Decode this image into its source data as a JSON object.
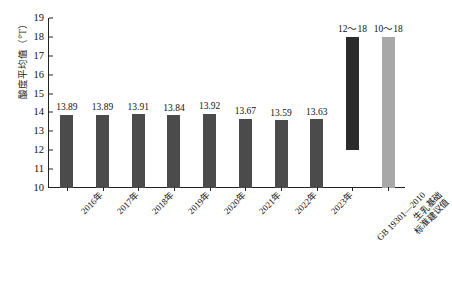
{
  "chart_data": {
    "type": "bar",
    "title": "",
    "xlabel": "",
    "ylabel": "酸度平均值（°T）",
    "ylim": [
      10,
      19
    ],
    "yticks": [
      10,
      11,
      12,
      13,
      14,
      15,
      16,
      17,
      18,
      19
    ],
    "grid": false,
    "legend": null,
    "categories": [
      "2016年",
      "2017年",
      "2018年",
      "2019年",
      "2020年",
      "2021年",
      "2022年",
      "2023年",
      "GB 19301—2010",
      "生乳基础\n标准建议值"
    ],
    "values": [
      13.89,
      13.89,
      13.91,
      13.84,
      13.92,
      13.67,
      13.59,
      13.63,
      null,
      18
    ],
    "data_labels": [
      "13.89",
      "13.89",
      "13.91",
      "13.84",
      "13.92",
      "13.67",
      "13.59",
      "13.63",
      "12～18",
      "10～18"
    ],
    "bars": [
      {
        "category": "2016年",
        "label": "13.89",
        "low": 10,
        "high": 13.89,
        "color": "#4b4b4b",
        "kind": "year"
      },
      {
        "category": "2017年",
        "label": "13.89",
        "low": 10,
        "high": 13.89,
        "color": "#4b4b4b",
        "kind": "year"
      },
      {
        "category": "2018年",
        "label": "13.91",
        "low": 10,
        "high": 13.91,
        "color": "#4b4b4b",
        "kind": "year"
      },
      {
        "category": "2019年",
        "label": "13.84",
        "low": 10,
        "high": 13.84,
        "color": "#4b4b4b",
        "kind": "year"
      },
      {
        "category": "2020年",
        "label": "13.92",
        "low": 10,
        "high": 13.92,
        "color": "#4b4b4b",
        "kind": "year"
      },
      {
        "category": "2021年",
        "label": "13.67",
        "low": 10,
        "high": 13.67,
        "color": "#4b4b4b",
        "kind": "year"
      },
      {
        "category": "2022年",
        "label": "13.59",
        "low": 10,
        "high": 13.59,
        "color": "#4b4b4b",
        "kind": "year"
      },
      {
        "category": "2023年",
        "label": "13.63",
        "low": 10,
        "high": 13.63,
        "color": "#4b4b4b",
        "kind": "year"
      },
      {
        "category": "GB 19301—2010",
        "label": "12～18",
        "low": 12,
        "high": 18,
        "color": "#2b2b2b",
        "kind": "range"
      },
      {
        "category": "生乳基础标准建议值",
        "label": "10～18",
        "low": 10,
        "high": 18,
        "color": "#a8a8a8",
        "kind": "range"
      }
    ],
    "xtick_labels": [
      {
        "text": "2016年",
        "lines": [
          "2016年"
        ]
      },
      {
        "text": "2017年",
        "lines": [
          "2017年"
        ]
      },
      {
        "text": "2018年",
        "lines": [
          "2018年"
        ]
      },
      {
        "text": "2019年",
        "lines": [
          "2019年"
        ]
      },
      {
        "text": "2020年",
        "lines": [
          "2020年"
        ]
      },
      {
        "text": "2021年",
        "lines": [
          "2021年"
        ]
      },
      {
        "text": "2022年",
        "lines": [
          "2022年"
        ]
      },
      {
        "text": "2023年",
        "lines": [
          "2023年"
        ]
      },
      {
        "text": "GB 19301—2010",
        "lines": [
          "GB 19301—2010"
        ]
      },
      {
        "text": "生乳基础标准建议值",
        "lines": [
          "生乳基础",
          "标准建议值"
        ]
      }
    ],
    "colors": {
      "year_bar": "#4b4b4b",
      "standard_bar": "#2b2b2b",
      "suggested_bar": "#a8a8a8",
      "axis": "#222222",
      "text": "#111111",
      "background": "#ffffff"
    }
  }
}
